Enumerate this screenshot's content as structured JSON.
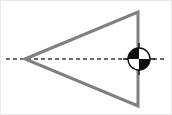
{
  "figure": {
    "title": "Triangle with centroid marker on vertical edge",
    "canvas": {
      "width": 172,
      "height": 115,
      "background_color": "#ffffff",
      "border_color": "#e8e8e8"
    },
    "shapes": {
      "triangle": {
        "label": "triangle",
        "description": "Isosceles triangle pointing left",
        "stroke_color": "#808080",
        "stroke_width": 3,
        "fill": "none",
        "points": "24,58 137,11 137,105",
        "vertices": [
          {
            "name": "left-apex",
            "x": 24,
            "y": 58
          },
          {
            "name": "top-right",
            "x": 137,
            "y": 11
          },
          {
            "name": "bottom-right",
            "x": 137,
            "y": 105
          }
        ]
      },
      "axis_line": {
        "label": "horizontal axis of symmetry",
        "stroke_color": "#3a3a3a",
        "stroke_width": 1.6,
        "dash_pattern": "4 3",
        "x1": 5,
        "y1": 58,
        "x2": 164,
        "y2": 58
      },
      "centroid_marker": {
        "label": "centroid symbol",
        "description": "Quartered circle center-of-mass marker",
        "center_x": 138,
        "center_y": 58,
        "radius": 11,
        "dark_color": "#111111",
        "light_color": "#ffffff",
        "outline_color": "#111111",
        "crosshair_color": "#111111",
        "crosshair_extent": 5,
        "quadrants": [
          {
            "name": "top-left",
            "fill": "#111111"
          },
          {
            "name": "top-right",
            "fill": "#ffffff"
          },
          {
            "name": "bottom-left",
            "fill": "#ffffff"
          },
          {
            "name": "bottom-right",
            "fill": "#111111"
          }
        ]
      }
    }
  }
}
